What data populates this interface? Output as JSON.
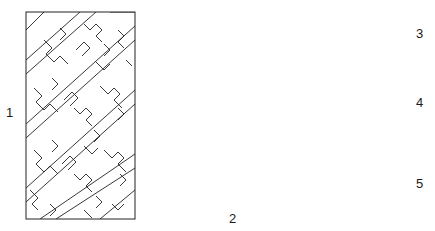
{
  "figure": {
    "panels": [
      {
        "id": 1,
        "label": "1",
        "pattern": "interlocking-fret-meander",
        "box": [
          26,
          12,
          135,
          219
        ]
      },
      {
        "id": 2,
        "label": "2",
        "pattern": "star-cross-tessellation-diamond",
        "box": [
          152,
          36,
          314,
          210
        ]
      },
      {
        "id": 3,
        "label": "3",
        "pattern": "brick-bond",
        "box": [
          327,
          12,
          408,
          53
        ]
      },
      {
        "id": 4,
        "label": "4",
        "pattern": "ogee-lattice",
        "box": [
          328,
          70,
          408,
          133
        ]
      },
      {
        "id": 5,
        "label": "5",
        "pattern": "fish-scale",
        "box": [
          328,
          149,
          408,
          219
        ]
      }
    ],
    "line_color": "#222222",
    "background": "#ffffff"
  }
}
